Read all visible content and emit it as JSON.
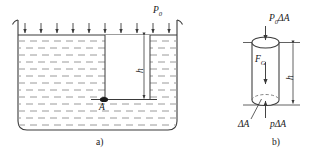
{
  "figure": {
    "width": 318,
    "height": 158,
    "stroke_color": "#3a3a3a",
    "hatch_color": "#9a9a9a",
    "text_color": "#171717",
    "background": "#ffffff"
  },
  "panel_a": {
    "caption": "a)",
    "ambient_pressure_label": "P",
    "ambient_pressure_sub": "0",
    "depth_label": "h",
    "point_label": "A",
    "arrow_count": 10,
    "description": "Open vessel filled with liquid, atmospheric pressure arrows on free surface, vertical column of depth h down to point A"
  },
  "panel_b": {
    "caption": "b)",
    "top_force_label": "P",
    "top_force_sub": "0",
    "top_force_tail": "ΔA",
    "weight_label": "F",
    "weight_sub": "G",
    "depth_label": "h",
    "area_label": "ΔA",
    "bottom_force_label": "p",
    "bottom_force_tail": "ΔA",
    "description": "Free-body diagram of cylindrical fluid element: downward P0ΔA on top face, downward weight F_G, upward pΔA on bottom face of area ΔA, height h"
  }
}
